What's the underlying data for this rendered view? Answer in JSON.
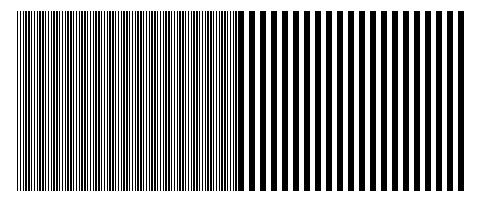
{
  "figure": {
    "width": 485,
    "height": 203,
    "background_color": "#ffffff",
    "bar_color": "#000000"
  },
  "chart_data": {
    "type": "bar",
    "subtitle": "",
    "xlabel": "",
    "ylabel": "",
    "grid": false,
    "legend": null,
    "axis_visible": false,
    "tick_labels": [],
    "xlim": [
      0,
      485
    ],
    "ylim": [
      0,
      203
    ],
    "annotations": [],
    "pattern_geometry": {
      "plot_top_y": 11,
      "plot_bottom_y": 191,
      "bar_height": 180,
      "transition_x": 238
    },
    "categories": [
      "high-frequency region",
      "low-frequency region"
    ],
    "values": [
      79,
      21
    ],
    "series": [
      {
        "name": "high-frequency region",
        "region_index": 0,
        "x_start": 17,
        "x_end": 238,
        "span_width": 221,
        "bar_count": 79,
        "period_px": 2.8,
        "bar_width_px": 1.4,
        "gap_width_px": 1.4,
        "duty_cycle": 0.5,
        "cycles_per_100px": 35.7,
        "color": "#000000"
      },
      {
        "name": "low-frequency region",
        "region_index": 1,
        "x_start": 238,
        "x_end": 468,
        "span_width": 230,
        "bar_count": 21,
        "period_px": 11.0,
        "bar_width_px": 6.0,
        "gap_width_px": 5.0,
        "duty_cycle": 0.545,
        "cycles_per_100px": 9.1,
        "color": "#000000"
      }
    ]
  }
}
